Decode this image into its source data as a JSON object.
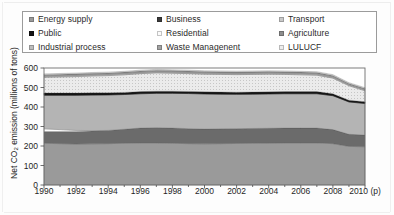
{
  "legend": {
    "items": [
      {
        "label": "Energy supply",
        "color": "#9a9a9a",
        "name": "legend-energy-supply"
      },
      {
        "label": "Business",
        "color": "#3b3b3b",
        "name": "legend-business"
      },
      {
        "label": "Transport",
        "color": "#c9c9c9",
        "name": "legend-transport"
      },
      {
        "label": "Public",
        "color": "#141414",
        "name": "legend-public"
      },
      {
        "label": "Residential",
        "color": "#fbfbfb",
        "name": "legend-residential"
      },
      {
        "label": "Agriculture",
        "color": "#8e8e8e",
        "name": "legend-agriculture"
      },
      {
        "label": "Industrial process",
        "color": "#bdbdbd",
        "name": "legend-industrial-process"
      },
      {
        "label": "Waste Managenent",
        "color": "#a3a3a3",
        "name": "legend-waste-management"
      },
      {
        "label": "LULUCF",
        "color": "#ededed",
        "name": "legend-lulucf"
      }
    ]
  },
  "axes": {
    "ylabel_main": "Net CO",
    "ylabel_sub": "2",
    "ylabel_tail": " emission (millions of tons)",
    "yticks": [
      "600",
      "500",
      "400",
      "300",
      "200",
      "100",
      "0"
    ],
    "ylim": [
      0,
      600
    ],
    "xticks": [
      "1990",
      "1992",
      "1994",
      "1996",
      "1998",
      "2000",
      "2002",
      "2004",
      "2006",
      "2008",
      "2010 (p)"
    ],
    "xlim": [
      1990,
      2010
    ]
  },
  "chart_data": {
    "type": "area",
    "title": "",
    "xlabel": "",
    "ylabel": "Net CO2 emission (millions of tons)",
    "ylim": [
      0,
      600
    ],
    "xlim": [
      1990,
      2010
    ],
    "grid": false,
    "legend_position": "top",
    "stacked": true,
    "x": [
      1990,
      1991,
      1992,
      1993,
      1994,
      1995,
      1996,
      1997,
      1998,
      1999,
      2000,
      2001,
      2002,
      2003,
      2004,
      2005,
      2006,
      2007,
      2008,
      2009,
      2010
    ],
    "x_labels": [
      "1990",
      "1991",
      "1992",
      "1993",
      "1994",
      "1995",
      "1996",
      "1997",
      "1998",
      "1999",
      "2000",
      "2001",
      "2002",
      "2003",
      "2004",
      "2005",
      "2006",
      "2007",
      "2008",
      "2009",
      "2010 (p)"
    ],
    "series": [
      {
        "name": "Energy supply",
        "color": "#9a9a9a",
        "values": [
          214,
          212,
          210,
          211,
          212,
          214,
          216,
          216,
          214,
          212,
          211,
          212,
          213,
          214,
          215,
          216,
          216,
          216,
          212,
          198,
          196
        ]
      },
      {
        "name": "Industrial process",
        "color": "#6b6b6b",
        "values": [
          60,
          62,
          64,
          66,
          68,
          72,
          76,
          78,
          78,
          77,
          76,
          76,
          76,
          76,
          76,
          76,
          76,
          76,
          72,
          62,
          60
        ]
      },
      {
        "name": "Residential",
        "color": "#fdfdfd",
        "values": [
          14,
          10,
          6,
          2,
          0,
          0,
          0,
          0,
          0,
          0,
          0,
          0,
          0,
          0,
          0,
          0,
          0,
          0,
          0,
          0,
          0
        ]
      },
      {
        "name": "Business",
        "color": "#b4b4b4",
        "values": [
          172,
          176,
          180,
          182,
          182,
          178,
          176,
          176,
          178,
          180,
          180,
          178,
          176,
          176,
          176,
          176,
          176,
          176,
          174,
          166,
          162
        ]
      },
      {
        "name": "Public",
        "color": "#151515",
        "values": [
          12,
          12,
          12,
          12,
          11,
          11,
          11,
          11,
          11,
          11,
          11,
          11,
          11,
          11,
          11,
          11,
          11,
          11,
          10,
          9,
          9
        ]
      },
      {
        "name": "Transport",
        "color": "#e0e0e0",
        "values": [
          80,
          82,
          84,
          86,
          88,
          90,
          92,
          94,
          92,
          91,
          90,
          90,
          90,
          90,
          90,
          88,
          86,
          84,
          80,
          74,
          56
        ]
      },
      {
        "name": "Agriculture",
        "color": "#a8a8a8",
        "values": [
          8,
          8,
          8,
          8,
          8,
          8,
          8,
          8,
          8,
          8,
          8,
          8,
          8,
          8,
          8,
          8,
          8,
          8,
          8,
          7,
          7
        ]
      },
      {
        "name": "Waste Managenent",
        "color": "#8e8e8e",
        "values": [
          6,
          6,
          6,
          6,
          6,
          6,
          6,
          6,
          6,
          6,
          6,
          6,
          6,
          6,
          6,
          6,
          6,
          6,
          6,
          5,
          5
        ]
      },
      {
        "name": "LULUCF",
        "color": "#f2f2f2",
        "values": [
          4,
          4,
          4,
          4,
          4,
          4,
          4,
          4,
          4,
          4,
          4,
          4,
          4,
          4,
          4,
          4,
          4,
          4,
          4,
          4,
          4
        ]
      }
    ],
    "totals": [
      570,
      572,
      574,
      577,
      579,
      583,
      589,
      593,
      591,
      589,
      586,
      585,
      584,
      585,
      586,
      585,
      583,
      581,
      566,
      525,
      499
    ]
  }
}
